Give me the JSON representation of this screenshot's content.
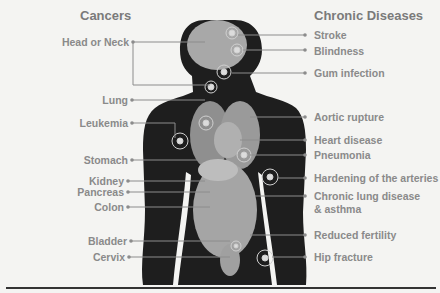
{
  "headings": {
    "left": "Cancers",
    "right": "Chronic Diseases"
  },
  "cancers": [
    {
      "label": "Head or Neck",
      "y": 42
    },
    {
      "label": "Lung",
      "y": 100
    },
    {
      "label": "Leukemia",
      "y": 123
    },
    {
      "label": "Stomach",
      "y": 160
    },
    {
      "label": "Kidney",
      "y": 181
    },
    {
      "label": "Pancreas",
      "y": 192
    },
    {
      "label": "Colon",
      "y": 207
    },
    {
      "label": "Bladder",
      "y": 241
    },
    {
      "label": "Cervix",
      "y": 257
    }
  ],
  "chronic_diseases": [
    {
      "label": "Stroke",
      "y": 35
    },
    {
      "label": "Blindness",
      "y": 52
    },
    {
      "label": "Gum infection",
      "y": 73
    },
    {
      "label": "Aortic rupture",
      "y": 117
    },
    {
      "label": "Heart disease",
      "y": 140
    },
    {
      "label": "Pneumonia",
      "y": 155
    },
    {
      "label": "Hardening of the arteries",
      "y": 178
    },
    {
      "label": "Chronic lung disease",
      "label2": "& asthma",
      "y": 196
    },
    {
      "label": "Reduced fertility",
      "y": 235
    },
    {
      "label": "Hip fracture",
      "y": 257
    }
  ],
  "colors": {
    "silhouette": "#1e1e1e",
    "organ": "#9a9a9a",
    "text": "#8a8a8a",
    "line": "#8c8c8c",
    "background": "#f4f4f2"
  }
}
